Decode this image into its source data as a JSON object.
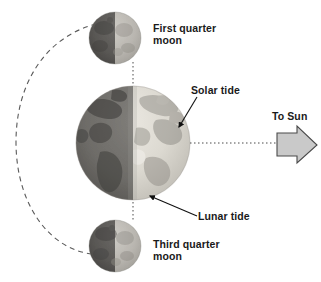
{
  "diagram": {
    "background_color": "#ffffff",
    "text_color": "#1a1a1a",
    "labels": {
      "first_quarter_moon": "First quarter\nmoon",
      "third_quarter_moon": "Third quarter\nmoon",
      "solar_tide": "Solar tide",
      "lunar_tide": "Lunar tide",
      "to_sun": "To Sun"
    },
    "bodies": [
      {
        "name": "earth",
        "label": "Earth",
        "cx": 133,
        "cy": 143,
        "r": 57,
        "night_side": "left",
        "day_color": "#d8d5cd",
        "night_color": "#6e6c69"
      },
      {
        "name": "first-quarter-moon",
        "label": "First quarter moon",
        "cx": 115,
        "cy": 38,
        "r": 26,
        "night_side": "left",
        "day_color": "#bab7b1",
        "night_color": "#5c5a57"
      },
      {
        "name": "third-quarter-moon",
        "label": "Third quarter moon",
        "cx": 115,
        "cy": 246,
        "r": 26,
        "night_side": "left",
        "day_color": "#b2afa9",
        "night_color": "#5a5855"
      }
    ],
    "sun_arrow": {
      "label": "To Sun",
      "direction": "right",
      "fill_color": "#c9c9c9",
      "stroke_color": "#4a4a4a",
      "x": 277,
      "y": 127,
      "width": 40,
      "height": 36
    },
    "guide_lines": [
      {
        "name": "moon-axis-dotted-line",
        "style": "dotted",
        "orientation": "vertical",
        "from": [
          133,
          62
        ],
        "to": [
          133,
          222
        ]
      },
      {
        "name": "sun-axis-dotted-line",
        "style": "dotted",
        "orientation": "horizontal",
        "from": [
          190,
          143
        ],
        "to": [
          278,
          143
        ]
      }
    ],
    "orbit": {
      "name": "moon-orbit-path",
      "style": "dashed",
      "direction": "counterclockwise",
      "stroke_color": "#555555"
    },
    "leader_lines": [
      {
        "name": "solar-tide-leader",
        "from": [
          196,
          96
        ],
        "to": [
          178,
          128
        ]
      },
      {
        "name": "lunar-tide-leader",
        "from": [
          196,
          215
        ],
        "to": [
          149,
          195
        ]
      }
    ]
  }
}
